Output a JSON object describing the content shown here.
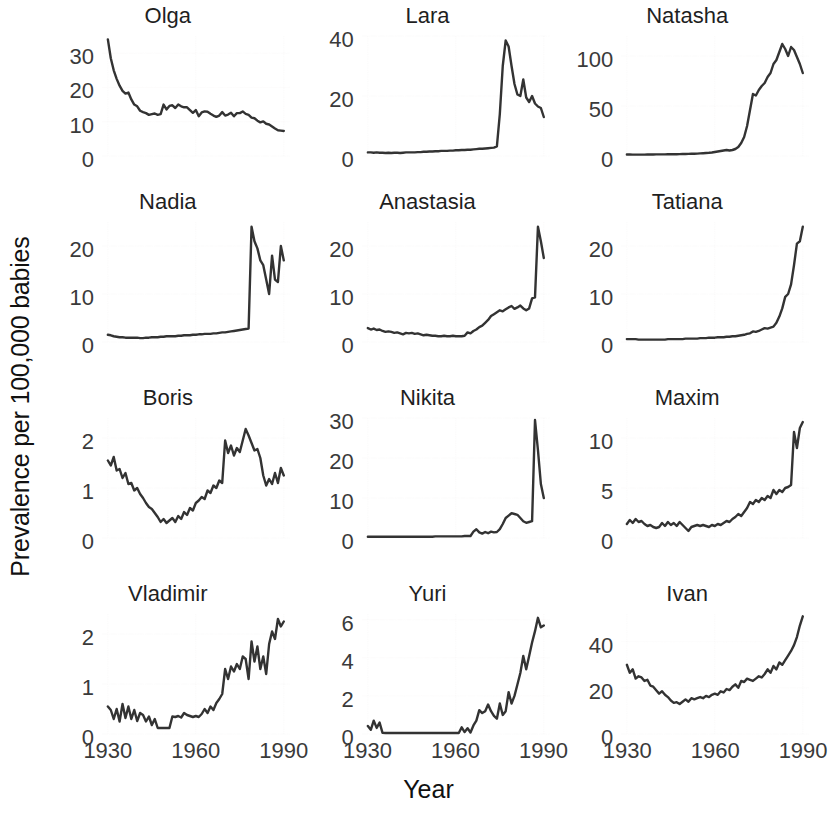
{
  "figure": {
    "ylabel": "Prevalence per 100,000 babies",
    "xlabel": "Year"
  },
  "chart_data": {
    "type": "line",
    "title": "",
    "subtitle": "",
    "xlabel": "Year",
    "ylabel": "Prevalence per 100,000 babies",
    "grid": true,
    "legend": "none",
    "layout": "small-multiples 4 rows x 3 columns",
    "x": [
      1930,
      1931,
      1932,
      1933,
      1934,
      1935,
      1936,
      1937,
      1938,
      1939,
      1940,
      1941,
      1942,
      1943,
      1944,
      1945,
      1946,
      1947,
      1948,
      1949,
      1950,
      1951,
      1952,
      1953,
      1954,
      1955,
      1956,
      1957,
      1958,
      1959,
      1960,
      1961,
      1962,
      1963,
      1964,
      1965,
      1966,
      1967,
      1968,
      1969,
      1970,
      1971,
      1972,
      1973,
      1974,
      1975,
      1976,
      1977,
      1978,
      1979,
      1980,
      1981,
      1982,
      1983,
      1984,
      1985,
      1986,
      1987,
      1988,
      1989,
      1990
    ],
    "xlim": [
      1928,
      1992
    ],
    "xticks": [
      1930,
      1960,
      1990
    ],
    "xticklabels": [
      "1930",
      "1960",
      "1990"
    ],
    "panels": [
      {
        "name": "Olga",
        "row": 1,
        "col": 1,
        "ylim": [
          0,
          35
        ],
        "yticks": [
          0,
          10,
          20,
          30
        ],
        "yticklabels": [
          "0",
          "10",
          "20",
          "30"
        ],
        "values": [
          34.0,
          28.5,
          25.0,
          22.5,
          20.5,
          19.0,
          18.2,
          18.5,
          16.5,
          15.0,
          14.5,
          13.2,
          12.8,
          12.5,
          12.0,
          12.2,
          12.4,
          12.0,
          12.2,
          15.0,
          13.6,
          14.6,
          14.8,
          14.0,
          15.0,
          14.5,
          14.2,
          14.2,
          13.4,
          12.6,
          13.4,
          11.6,
          12.7,
          13.0,
          12.9,
          12.3,
          11.8,
          11.4,
          11.8,
          12.8,
          11.8,
          12.1,
          12.6,
          11.6,
          12.5,
          12.5,
          13.0,
          12.3,
          12.0,
          11.2,
          11.0,
          10.3,
          9.8,
          10.1,
          9.4,
          9.2,
          8.6,
          8.0,
          7.5,
          7.4,
          7.3
        ]
      },
      {
        "name": "Lara",
        "row": 1,
        "col": 2,
        "ylim": [
          0,
          40
        ],
        "yticks": [
          0,
          20,
          40
        ],
        "yticklabels": [
          "0",
          "20",
          "40"
        ],
        "values": [
          1.2,
          1.2,
          1.1,
          1.2,
          1.1,
          1.1,
          1.0,
          1.1,
          1.0,
          1.1,
          1.1,
          1.0,
          1.1,
          1.2,
          1.2,
          1.2,
          1.2,
          1.3,
          1.3,
          1.4,
          1.4,
          1.5,
          1.5,
          1.6,
          1.6,
          1.7,
          1.7,
          1.7,
          1.8,
          1.8,
          1.9,
          1.9,
          2.0,
          2.0,
          2.1,
          2.1,
          2.2,
          2.3,
          2.4,
          2.4,
          2.5,
          2.6,
          2.7,
          2.8,
          3.2,
          14.0,
          30.0,
          38.5,
          36.5,
          30.0,
          24.0,
          20.5,
          20.0,
          25.5,
          19.5,
          18.0,
          20.0,
          17.5,
          16.5,
          16.0,
          13.0
        ]
      },
      {
        "name": "Natasha",
        "row": 1,
        "col": 3,
        "ylim": [
          0,
          120
        ],
        "yticks": [
          0,
          50,
          100
        ],
        "yticklabels": [
          "0",
          "50",
          "100"
        ],
        "values": [
          1.5,
          1.5,
          1.4,
          1.4,
          1.4,
          1.4,
          1.4,
          1.5,
          1.5,
          1.5,
          1.6,
          1.6,
          1.6,
          1.6,
          1.7,
          1.7,
          1.8,
          1.8,
          1.9,
          2.0,
          2.0,
          2.1,
          2.2,
          2.3,
          2.4,
          2.6,
          2.8,
          3.0,
          3.2,
          3.5,
          4.0,
          4.5,
          5.0,
          5.5,
          6.0,
          5.5,
          6.0,
          7.0,
          9.0,
          13.0,
          19.0,
          30.0,
          46.0,
          62.0,
          60.5,
          66.0,
          70.0,
          73.0,
          79.0,
          83.0,
          92.0,
          96.0,
          104.0,
          112.0,
          107.0,
          100.0,
          109.0,
          106.0,
          99.0,
          92.0,
          83.0
        ]
      },
      {
        "name": "Nadia",
        "row": 2,
        "col": 1,
        "ylim": [
          0,
          25
        ],
        "yticks": [
          0,
          10,
          20
        ],
        "yticklabels": [
          "0",
          "10",
          "20"
        ],
        "values": [
          1.5,
          1.4,
          1.2,
          1.1,
          1.0,
          1.0,
          0.9,
          0.9,
          0.9,
          0.9,
          0.9,
          0.8,
          0.8,
          0.9,
          0.9,
          1.0,
          1.0,
          1.0,
          1.1,
          1.1,
          1.2,
          1.2,
          1.2,
          1.2,
          1.3,
          1.3,
          1.4,
          1.4,
          1.4,
          1.5,
          1.5,
          1.6,
          1.6,
          1.7,
          1.7,
          1.7,
          1.8,
          1.8,
          1.9,
          2.0,
          2.0,
          2.1,
          2.2,
          2.3,
          2.4,
          2.5,
          2.6,
          2.7,
          2.8,
          24.0,
          21.0,
          19.5,
          17.0,
          16.0,
          13.0,
          10.0,
          18.0,
          13.0,
          12.5,
          20.0,
          17.0
        ]
      },
      {
        "name": "Anastasia",
        "row": 2,
        "col": 2,
        "ylim": [
          0,
          25
        ],
        "yticks": [
          0,
          10,
          20
        ],
        "yticklabels": [
          "0",
          "10",
          "20"
        ],
        "values": [
          2.9,
          2.6,
          2.8,
          2.5,
          2.6,
          2.3,
          2.1,
          2.2,
          2.1,
          1.9,
          2.0,
          1.8,
          1.6,
          1.9,
          1.8,
          1.9,
          1.7,
          1.8,
          1.6,
          1.4,
          1.5,
          1.4,
          1.3,
          1.3,
          1.2,
          1.2,
          1.3,
          1.2,
          1.2,
          1.3,
          1.2,
          1.2,
          1.2,
          1.3,
          2.0,
          1.8,
          2.3,
          2.6,
          3.1,
          3.4,
          4.0,
          4.6,
          5.4,
          5.8,
          6.2,
          6.6,
          6.4,
          6.8,
          7.2,
          7.5,
          6.9,
          7.2,
          7.6,
          7.0,
          6.6,
          7.0,
          9.1,
          9.3,
          24.0,
          21.0,
          17.5
        ]
      },
      {
        "name": "Tatiana",
        "row": 2,
        "col": 3,
        "ylim": [
          0,
          25
        ],
        "yticks": [
          0,
          10,
          20
        ],
        "yticklabels": [
          "0",
          "10",
          "20"
        ],
        "values": [
          0.6,
          0.6,
          0.6,
          0.6,
          0.5,
          0.5,
          0.5,
          0.5,
          0.5,
          0.5,
          0.5,
          0.5,
          0.5,
          0.5,
          0.6,
          0.6,
          0.6,
          0.6,
          0.6,
          0.6,
          0.7,
          0.7,
          0.7,
          0.7,
          0.7,
          0.8,
          0.8,
          0.8,
          0.9,
          0.9,
          0.9,
          1.0,
          1.0,
          1.0,
          1.1,
          1.1,
          1.2,
          1.2,
          1.3,
          1.4,
          1.5,
          1.7,
          1.8,
          2.2,
          2.1,
          2.3,
          2.6,
          2.9,
          2.8,
          3.0,
          3.2,
          4.0,
          5.3,
          7.0,
          9.4,
          10.0,
          12.0,
          16.0,
          20.5,
          21.0,
          24.0
        ]
      },
      {
        "name": "Boris",
        "row": 3,
        "col": 1,
        "ylim": [
          0,
          2.4
        ],
        "yticks": [
          0,
          1,
          2
        ],
        "yticklabels": [
          "0",
          "1",
          "2"
        ],
        "values": [
          1.55,
          1.45,
          1.62,
          1.35,
          1.38,
          1.2,
          1.3,
          1.08,
          1.1,
          0.95,
          1.0,
          0.88,
          0.8,
          0.7,
          0.62,
          0.58,
          0.5,
          0.42,
          0.32,
          0.38,
          0.3,
          0.35,
          0.4,
          0.32,
          0.44,
          0.38,
          0.52,
          0.46,
          0.6,
          0.55,
          0.7,
          0.75,
          0.82,
          0.78,
          0.95,
          0.9,
          1.05,
          1.0,
          1.15,
          1.1,
          1.95,
          1.7,
          1.85,
          1.65,
          1.8,
          1.72,
          1.95,
          2.18,
          2.05,
          1.9,
          1.75,
          1.78,
          1.6,
          1.25,
          1.05,
          1.18,
          1.08,
          1.3,
          1.1,
          1.4,
          1.25
        ]
      },
      {
        "name": "Nikita",
        "row": 3,
        "col": 2,
        "ylim": [
          0,
          30
        ],
        "yticks": [
          0,
          10,
          20,
          30
        ],
        "yticklabels": [
          "0",
          "10",
          "20",
          "30"
        ],
        "values": [
          0.3,
          0.3,
          0.3,
          0.3,
          0.3,
          0.3,
          0.3,
          0.3,
          0.3,
          0.3,
          0.3,
          0.3,
          0.3,
          0.3,
          0.3,
          0.3,
          0.3,
          0.3,
          0.3,
          0.3,
          0.3,
          0.3,
          0.3,
          0.4,
          0.4,
          0.4,
          0.4,
          0.4,
          0.4,
          0.4,
          0.4,
          0.4,
          0.4,
          0.5,
          0.5,
          0.5,
          1.6,
          2.2,
          1.4,
          1.1,
          1.5,
          1.2,
          1.6,
          1.4,
          1.5,
          2.2,
          3.5,
          5.0,
          5.6,
          6.2,
          6.0,
          5.8,
          5.0,
          4.2,
          3.8,
          4.0,
          4.2,
          29.5,
          22.0,
          13.5,
          10.0
        ]
      },
      {
        "name": "Maxim",
        "row": 3,
        "col": 3,
        "ylim": [
          0,
          12
        ],
        "yticks": [
          0,
          5,
          10
        ],
        "yticklabels": [
          "0",
          "5",
          "10"
        ],
        "values": [
          1.4,
          1.8,
          1.5,
          1.9,
          1.6,
          1.7,
          1.4,
          1.2,
          1.3,
          1.1,
          1.0,
          1.1,
          1.5,
          1.2,
          1.6,
          1.3,
          1.5,
          1.2,
          1.6,
          1.3,
          1.0,
          0.7,
          1.1,
          1.2,
          1.3,
          1.2,
          1.3,
          1.2,
          1.1,
          1.3,
          1.2,
          1.4,
          1.3,
          1.5,
          1.7,
          1.6,
          1.9,
          2.1,
          2.4,
          2.2,
          2.6,
          3.0,
          3.6,
          3.4,
          3.8,
          3.6,
          4.0,
          3.8,
          4.2,
          4.0,
          4.8,
          4.4,
          4.8,
          4.6,
          5.0,
          5.1,
          5.3,
          10.6,
          9.0,
          11.0,
          11.6
        ]
      },
      {
        "name": "Vladimir",
        "row": 4,
        "col": 1,
        "ylim": [
          0,
          2.4
        ],
        "yticks": [
          0,
          1,
          2
        ],
        "yticklabels": [
          "0",
          "1",
          "2"
        ],
        "values": [
          0.55,
          0.48,
          0.3,
          0.5,
          0.25,
          0.6,
          0.32,
          0.55,
          0.3,
          0.48,
          0.26,
          0.42,
          0.38,
          0.25,
          0.35,
          0.18,
          0.3,
          0.12,
          0.12,
          0.12,
          0.12,
          0.12,
          0.35,
          0.34,
          0.36,
          0.33,
          0.42,
          0.38,
          0.36,
          0.34,
          0.36,
          0.34,
          0.4,
          0.5,
          0.42,
          0.55,
          0.48,
          0.62,
          0.7,
          0.8,
          1.3,
          1.1,
          1.35,
          1.25,
          1.4,
          1.3,
          1.55,
          1.5,
          1.1,
          1.85,
          1.45,
          1.75,
          1.3,
          1.55,
          1.2,
          1.8,
          2.05,
          1.9,
          2.3,
          2.15,
          2.25
        ]
      },
      {
        "name": "Yuri",
        "row": 4,
        "col": 2,
        "ylim": [
          0,
          6.3
        ],
        "yticks": [
          0,
          2,
          4,
          6
        ],
        "yticklabels": [
          "0",
          "2",
          "4",
          "6"
        ],
        "values": [
          0.42,
          0.22,
          0.7,
          0.32,
          0.6,
          0.06,
          0.05,
          0.05,
          0.05,
          0.05,
          0.05,
          0.05,
          0.05,
          0.05,
          0.05,
          0.05,
          0.05,
          0.05,
          0.05,
          0.05,
          0.05,
          0.05,
          0.05,
          0.05,
          0.05,
          0.05,
          0.05,
          0.05,
          0.05,
          0.05,
          0.05,
          0.05,
          0.35,
          0.1,
          0.3,
          0.08,
          0.45,
          0.7,
          1.25,
          1.1,
          1.2,
          1.55,
          1.2,
          0.95,
          0.8,
          1.6,
          1.0,
          1.2,
          2.2,
          1.6,
          2.0,
          2.6,
          3.2,
          4.1,
          3.4,
          4.1,
          4.8,
          5.4,
          6.1,
          5.6,
          5.7
        ]
      },
      {
        "name": "Ivan",
        "row": 4,
        "col": 3,
        "ylim": [
          0,
          52
        ],
        "yticks": [
          0,
          20,
          40
        ],
        "yticklabels": [
          "0",
          "20",
          "40"
        ],
        "values": [
          30.0,
          26.5,
          28.0,
          24.0,
          25.0,
          24.5,
          23.0,
          23.5,
          21.0,
          20.5,
          19.0,
          17.5,
          18.5,
          17.0,
          16.0,
          14.5,
          13.5,
          13.8,
          13.0,
          14.0,
          15.0,
          14.0,
          15.5,
          15.0,
          15.5,
          16.0,
          15.5,
          16.5,
          16.0,
          17.0,
          17.5,
          17.0,
          18.5,
          18.0,
          19.5,
          19.0,
          20.5,
          21.5,
          20.0,
          23.0,
          22.5,
          24.0,
          23.5,
          23.0,
          24.0,
          25.0,
          24.5,
          26.0,
          28.0,
          26.5,
          29.5,
          28.0,
          31.0,
          30.0,
          32.0,
          34.0,
          36.0,
          38.5,
          42.0,
          47.0,
          51.0
        ]
      }
    ]
  }
}
